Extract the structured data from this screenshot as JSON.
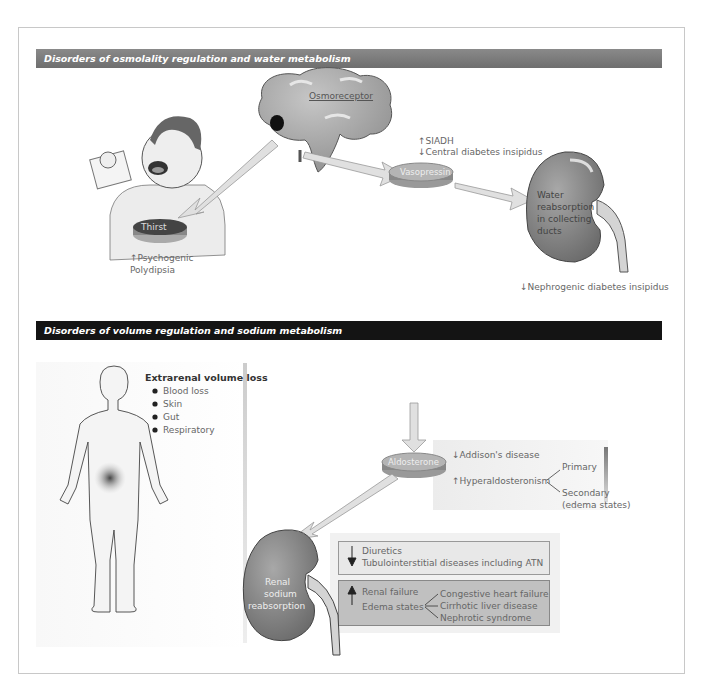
{
  "sections": [
    {
      "title": "Disorders of osmolality regulation and water metabolism",
      "header_color": "#777777",
      "nodes": {
        "osmoreceptor": "Osmoreceptor",
        "thirst": "Thirst",
        "vasopressin": "Vasopressin",
        "kidney_label": [
          "Water",
          "reabsorption",
          "in collecting",
          "ducts"
        ]
      },
      "annotations": {
        "siadh": "↑SIADH",
        "central_di": "↓Central diabetes insipidus",
        "psychogenic_1": "↑Psychogenic",
        "psychogenic_2": "Polydipsia",
        "nephrogenic_di": "↓Nephrogenic diabetes insipidus"
      }
    },
    {
      "title": "Disorders of volume regulation and sodium metabolism",
      "header_color": "#141414",
      "extrarenal": {
        "title": "Extrarenal volume loss",
        "items": [
          "Blood loss",
          "Skin",
          "Gut",
          "Respiratory"
        ]
      },
      "aldosterone": {
        "label": "Aldosterone",
        "addisons": "↓Addison's disease",
        "hyperaldo": "↑Hyperaldosteronism",
        "primary": "Primary",
        "secondary_1": "Secondary",
        "secondary_2": "(edema states)"
      },
      "kidney_label": [
        "Renal",
        "sodium",
        "reabsorption"
      ],
      "decrease_box": {
        "items": [
          "Diuretics",
          "Tubulointerstitial diseases including ATN"
        ]
      },
      "increase_box": {
        "renal_failure": "Renal failure",
        "edema_states": "Edema states",
        "edema_causes": [
          "Congestive heart failure",
          "Cirrhotic liver disease",
          "Nephrotic syndrome"
        ]
      }
    }
  ]
}
